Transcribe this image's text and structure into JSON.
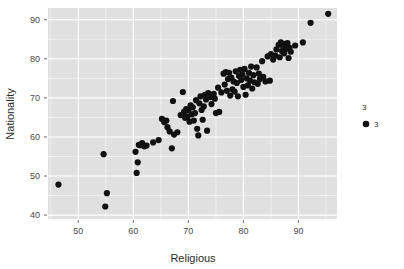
{
  "chart_data": {
    "type": "scatter",
    "title": "",
    "xlabel": "Religious",
    "ylabel": "Nationality",
    "xlim": [
      44.5,
      97.0
    ],
    "ylim": [
      39.0,
      93.0
    ],
    "xticks": [
      50,
      60,
      70,
      80,
      90
    ],
    "yticks": [
      40,
      50,
      60,
      70,
      80,
      90
    ],
    "xtick_labels": [
      "50",
      "60",
      "70",
      "80",
      "90"
    ],
    "ytick_labels": [
      "40",
      "50",
      "60",
      "70",
      "80",
      "90"
    ],
    "xminor": [
      45,
      55,
      65,
      75,
      85,
      95
    ],
    "yminor": [
      45,
      55,
      65,
      75,
      85
    ],
    "grid": true,
    "panel_background": "#e0e0e0",
    "grid_color": "#ffffff",
    "point_color": "#111111",
    "point_size": 4.4,
    "legend": {
      "position": "right",
      "title": "3",
      "entries": [
        {
          "label": "3",
          "marker": "circle",
          "color": "#111111"
        }
      ]
    },
    "series": [
      {
        "name": "3",
        "points": [
          [
            46.4,
            47.8
          ],
          [
            54.6,
            55.6
          ],
          [
            55.2,
            45.6
          ],
          [
            54.9,
            42.2
          ],
          [
            60.4,
            56.2
          ],
          [
            60.8,
            53.5
          ],
          [
            60.6,
            50.8
          ],
          [
            61.2,
            57.9
          ],
          [
            61.6,
            58.4
          ],
          [
            62.0,
            57.6
          ],
          [
            62.4,
            57.8
          ],
          [
            61.0,
            58.0
          ],
          [
            63.6,
            58.6
          ],
          [
            64.6,
            59.2
          ],
          [
            65.2,
            64.6
          ],
          [
            65.6,
            63.8
          ],
          [
            66.0,
            64.2
          ],
          [
            66.2,
            62.5
          ],
          [
            66.6,
            61.4
          ],
          [
            67.0,
            57.1
          ],
          [
            67.2,
            69.2
          ],
          [
            67.4,
            60.6
          ],
          [
            68.0,
            61.2
          ],
          [
            68.6,
            65.6
          ],
          [
            69.0,
            71.5
          ],
          [
            69.2,
            66.4
          ],
          [
            69.4,
            64.9
          ],
          [
            69.6,
            67.1
          ],
          [
            69.8,
            65.2
          ],
          [
            70.0,
            66.8
          ],
          [
            70.2,
            63.9
          ],
          [
            70.4,
            68.1
          ],
          [
            70.6,
            65.8
          ],
          [
            70.8,
            67.6
          ],
          [
            71.0,
            64.2
          ],
          [
            71.2,
            66.1
          ],
          [
            71.4,
            69.4
          ],
          [
            71.6,
            62.1
          ],
          [
            71.8,
            60.4
          ],
          [
            72.0,
            68.6
          ],
          [
            72.2,
            70.4
          ],
          [
            72.4,
            66.9
          ],
          [
            72.6,
            64.4
          ],
          [
            72.8,
            67.8
          ],
          [
            73.0,
            70.8
          ],
          [
            73.2,
            69.6
          ],
          [
            73.4,
            61.6
          ],
          [
            73.6,
            71.2
          ],
          [
            74.0,
            70.2
          ],
          [
            74.2,
            68.4
          ],
          [
            74.6,
            71.0
          ],
          [
            74.8,
            69.8
          ],
          [
            75.0,
            66.1
          ],
          [
            75.4,
            72.6
          ],
          [
            75.6,
            66.4
          ],
          [
            76.0,
            71.4
          ],
          [
            76.4,
            76.2
          ],
          [
            76.6,
            73.4
          ],
          [
            76.8,
            76.6
          ],
          [
            77.0,
            71.8
          ],
          [
            77.2,
            74.8
          ],
          [
            77.4,
            76.4
          ],
          [
            77.6,
            70.6
          ],
          [
            77.8,
            75.2
          ],
          [
            78.0,
            72.2
          ],
          [
            78.2,
            74.2
          ],
          [
            78.4,
            71.6
          ],
          [
            78.6,
            76.8
          ],
          [
            78.8,
            73.8
          ],
          [
            79.0,
            70.4
          ],
          [
            79.2,
            75.6
          ],
          [
            79.4,
            77.2
          ],
          [
            79.6,
            74.6
          ],
          [
            79.8,
            76.0
          ],
          [
            80.0,
            72.8
          ],
          [
            80.2,
            77.4
          ],
          [
            80.4,
            70.8
          ],
          [
            80.6,
            75.0
          ],
          [
            80.8,
            73.2
          ],
          [
            81.0,
            76.4
          ],
          [
            81.2,
            74.4
          ],
          [
            81.4,
            78.0
          ],
          [
            81.6,
            72.4
          ],
          [
            81.8,
            75.8
          ],
          [
            82.0,
            74.0
          ],
          [
            82.4,
            77.8
          ],
          [
            82.6,
            73.6
          ],
          [
            82.8,
            76.2
          ],
          [
            83.0,
            74.8
          ],
          [
            83.4,
            79.4
          ],
          [
            83.6,
            75.4
          ],
          [
            84.0,
            74.2
          ],
          [
            84.4,
            80.6
          ],
          [
            84.8,
            74.4
          ],
          [
            85.0,
            81.2
          ],
          [
            85.4,
            79.8
          ],
          [
            85.8,
            80.8
          ],
          [
            86.0,
            82.4
          ],
          [
            86.4,
            83.6
          ],
          [
            86.6,
            80.4
          ],
          [
            86.8,
            84.2
          ],
          [
            87.0,
            82.0
          ],
          [
            87.2,
            83.2
          ],
          [
            87.4,
            81.4
          ],
          [
            87.6,
            83.8
          ],
          [
            87.8,
            82.6
          ],
          [
            88.0,
            84.0
          ],
          [
            88.2,
            80.2
          ],
          [
            88.4,
            82.8
          ],
          [
            88.6,
            81.8
          ],
          [
            89.4,
            83.4
          ],
          [
            90.8,
            84.2
          ],
          [
            92.2,
            89.2
          ],
          [
            95.4,
            91.5
          ]
        ]
      }
    ]
  }
}
